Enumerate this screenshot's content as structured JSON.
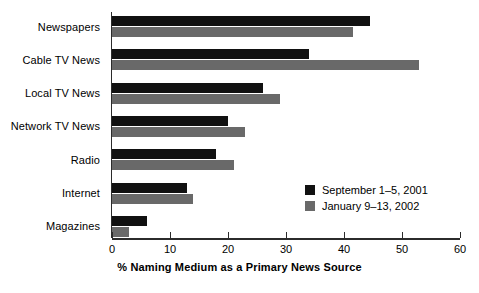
{
  "chart_data": {
    "type": "bar",
    "orientation": "horizontal",
    "title": "",
    "xlabel": "% Naming Medium as a Primary News Source",
    "ylabel": "",
    "xlim": [
      0,
      60
    ],
    "xticks": [
      0,
      10,
      20,
      30,
      40,
      50,
      60
    ],
    "xtick_labels": [
      "0",
      "10",
      "20",
      "30",
      "40",
      "50",
      "60"
    ],
    "grid": false,
    "legend_position": "inside-right",
    "categories": [
      "Newspapers",
      "Cable TV News",
      "Local TV News",
      "Network TV News",
      "Radio",
      "Internet",
      "Magazines"
    ],
    "series": [
      {
        "name": "September 1–5, 2001",
        "color": "#111111",
        "values": [
          44.5,
          34,
          26,
          20,
          18,
          13,
          6
        ]
      },
      {
        "name": "January 9–13, 2002",
        "color": "#696969",
        "values": [
          41.5,
          53,
          29,
          23,
          21,
          14,
          3
        ]
      }
    ]
  },
  "legend": {
    "items": [
      {
        "label": "September 1–5, 2001",
        "swatch": "#111111"
      },
      {
        "label": "January 9–13, 2002",
        "swatch": "#696969"
      }
    ]
  }
}
